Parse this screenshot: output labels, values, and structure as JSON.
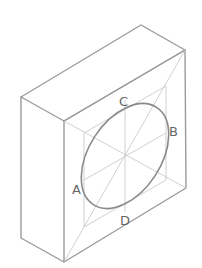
{
  "diagram": {
    "type": "isometric-box-with-inscribed-ellipse",
    "colors": {
      "edge": "#9a9a9a",
      "guide": "#c4c4c4",
      "ellipse": "#8a8a8a",
      "label": "#666666"
    },
    "labels": {
      "A": "A",
      "B": "B",
      "C": "C",
      "D": "D"
    }
  }
}
